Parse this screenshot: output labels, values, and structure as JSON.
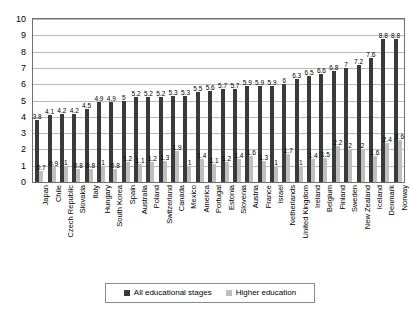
{
  "chart_data": {
    "type": "bar",
    "title": "",
    "xlabel": "",
    "ylabel": "",
    "ylim": [
      0,
      10
    ],
    "ytick_step": 1,
    "grid": true,
    "legend_position": "bottom",
    "yticks": [
      "10",
      "9",
      "8",
      "7",
      "6",
      "5",
      "4",
      "3",
      "2",
      "1",
      "0"
    ],
    "categories": [
      "Japan",
      "Chile",
      "Czech Republic",
      "Slovakia",
      "Italy",
      "Hungary",
      "South Korea",
      "Spain",
      "Australia",
      "Poland",
      "Switzerland",
      "Canada",
      "Mexico",
      "America",
      "Portugal",
      "Estonia",
      "Slovenia",
      "Austria",
      "France",
      "Israel",
      "Netherlands",
      "United Kingdom",
      "Ireland",
      "Belgium",
      "Finland",
      "Sweden",
      "New Zealand",
      "Iceland",
      "Denmark",
      "Norway"
    ],
    "series": [
      {
        "name": "All educational stages",
        "color": "#3a3a3a",
        "values": [
          3.8,
          4.1,
          4.2,
          4.2,
          4.5,
          4.9,
          4.9,
          5,
          5.2,
          5.2,
          5.2,
          5.3,
          5.3,
          5.5,
          5.6,
          5.7,
          5.7,
          5.9,
          5.9,
          5.9,
          6,
          6.3,
          6.5,
          6.6,
          6.8,
          7,
          7.2,
          7.6,
          8.8,
          8.8
        ],
        "labels": [
          "3.8",
          "4.1",
          "4.2",
          "4.2",
          "4.5",
          "4.9",
          "4.9",
          "5",
          "5.2",
          "5.2",
          "5.2",
          "5.3",
          "5.3",
          "5.5",
          "5.6",
          "5.7",
          "5.7",
          "5.9",
          "5.9",
          "5.9",
          "6",
          "6.3",
          "6.5",
          "6.6",
          "6.8",
          "7",
          "7.2",
          "7.6",
          "8.8",
          "8.8"
        ]
      },
      {
        "name": "Higher education",
        "color": "#bfbfbf",
        "values": [
          0.7,
          0.9,
          1,
          0.8,
          0.8,
          1,
          0.8,
          1.2,
          1.1,
          1.2,
          1.3,
          1.9,
          1,
          1.4,
          1.1,
          1.2,
          1.4,
          1.6,
          1.3,
          1,
          1.7,
          1,
          1.4,
          1.5,
          2.2,
          2,
          2,
          1.6,
          2.4,
          2.6
        ],
        "labels": [
          "0.7",
          "0.9",
          "1",
          "0.8",
          "0.8",
          "1",
          "0.8",
          "1.2",
          "1.1",
          "1.2",
          "1.3",
          "1.9",
          "1",
          "1.4",
          "1.1",
          "1.2",
          "1.4",
          "1.6",
          "1.3",
          "1",
          "1.7",
          "1",
          "1.4",
          "1.5",
          "2.2",
          "2",
          "2",
          "1.6",
          "2.4",
          "2.6"
        ]
      }
    ]
  },
  "legend": {
    "items": [
      {
        "label": "All educational stages",
        "color": "#3a3a3a"
      },
      {
        "label": "Higher education",
        "color": "#bfbfbf"
      }
    ]
  }
}
